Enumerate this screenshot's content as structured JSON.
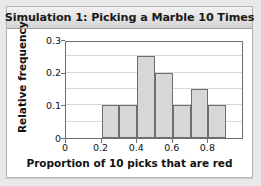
{
  "card": {
    "title": "Simulation 1: Picking a Marble 10 Times"
  },
  "chart_data": {
    "type": "bar",
    "title": "Simulation 1: Picking a Marble 10 Times",
    "xlabel": "Proportion of 10 picks that are red",
    "ylabel": "Relative frequency",
    "categories": [
      "0.2-0.3",
      "0.3-0.4",
      "0.4-0.5",
      "0.5-0.6",
      "0.6-0.7",
      "0.7-0.8",
      "0.8-0.9"
    ],
    "bin_edges": [
      0.2,
      0.3,
      0.4,
      0.5,
      0.6,
      0.7,
      0.8,
      0.9
    ],
    "values": [
      0.1,
      0.1,
      0.25,
      0.2,
      0.1,
      0.15,
      0.1
    ],
    "xlim": [
      0,
      1.0
    ],
    "ylim": [
      0,
      0.3
    ],
    "xticks": [
      0,
      0.2,
      0.4,
      0.6,
      0.8
    ],
    "xtick_labels": [
      "0",
      "0.2",
      "0.4",
      "0.6",
      "0.8"
    ],
    "yticks": [
      0,
      0.1,
      0.2,
      0.3
    ],
    "ytick_labels": [
      "0",
      "0.1",
      "0.2",
      "0.3"
    ],
    "gridlines_y": [
      0.05,
      0.1,
      0.15,
      0.2,
      0.25
    ],
    "grid": true,
    "legend": "none",
    "bar_fill": "#d7d7d7",
    "bar_edge": "#6e6e6e"
  }
}
